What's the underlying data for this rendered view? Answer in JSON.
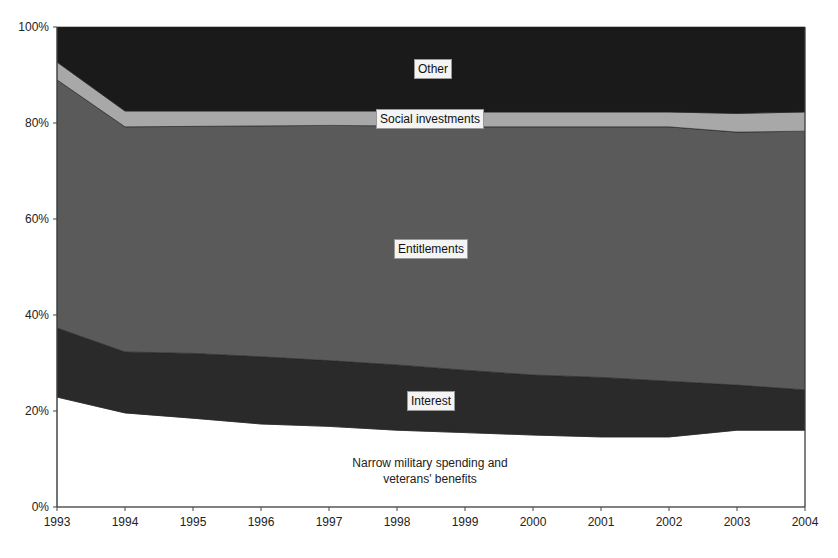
{
  "chart_data": {
    "type": "area",
    "stacked": "percent",
    "title": "",
    "xlabel": "",
    "ylabel": "",
    "x": [
      1993,
      1994,
      1995,
      1996,
      1997,
      1998,
      1999,
      2000,
      2001,
      2002,
      2003,
      2004
    ],
    "ylim": [
      0,
      100
    ],
    "yticks": [
      "0%",
      "20%",
      "40%",
      "60%",
      "80%",
      "100%"
    ],
    "grid": false,
    "legend": "inline labels",
    "series": [
      {
        "name": "Narrow military spending and veterans' benefits",
        "color": "#ffffff",
        "values": [
          22.9,
          19.6,
          18.5,
          17.3,
          16.8,
          16.0,
          15.5,
          15.0,
          14.6,
          14.6,
          16.0,
          16.0
        ]
      },
      {
        "name": "Interest",
        "color": "#2a2a2a",
        "values": [
          14.4,
          12.7,
          13.5,
          14.0,
          13.7,
          13.6,
          13.0,
          12.5,
          12.4,
          11.6,
          9.4,
          8.4
        ]
      },
      {
        "name": "Entitlements",
        "color": "#5a5a5a",
        "values": [
          51.7,
          46.9,
          47.3,
          48.1,
          49.0,
          49.8,
          50.7,
          51.7,
          52.2,
          53.0,
          52.7,
          53.9
        ]
      },
      {
        "name": "Social investments",
        "color": "#a8a8a8",
        "values": [
          3.7,
          3.3,
          3.2,
          3.1,
          3.0,
          3.1,
          3.1,
          3.1,
          3.1,
          3.1,
          3.9,
          4.0
        ]
      },
      {
        "name": "Other",
        "color": "#1a1a1a",
        "values": [
          7.3,
          17.5,
          17.5,
          17.5,
          17.5,
          17.5,
          17.7,
          17.7,
          17.7,
          17.7,
          18.0,
          17.7
        ]
      }
    ]
  },
  "labels": {
    "other": "Other",
    "social": "Social investments",
    "entitlements": "Entitlements",
    "interest": "Interest",
    "military_line1": "Narrow military spending and",
    "military_line2": "veterans' benefits"
  }
}
